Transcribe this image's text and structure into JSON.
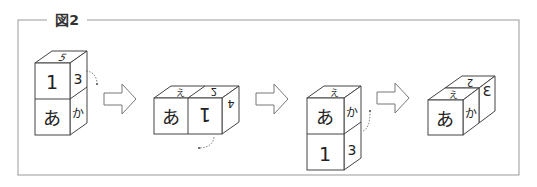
{
  "figure": {
    "title": "図2",
    "frame_color": "#999999",
    "line_color": "#444444"
  },
  "cubes": [
    {
      "id": "step1",
      "arrangement": "vertical-stack",
      "faces": {
        "top": "5",
        "upper_front": "1",
        "upper_side": "3",
        "lower_front": "あ",
        "lower_side": "か"
      },
      "rotation_hint": "curved dotted arrow from upper side face"
    },
    {
      "id": "step2",
      "arrangement": "horizontal-pair",
      "faces": {
        "left_top": "え",
        "right_top": "2",
        "left_front": "あ",
        "right_front": "1",
        "right_side": "4"
      },
      "rotation_hint": "curved dotted arrow below right cube"
    },
    {
      "id": "step3",
      "arrangement": "vertical-stack",
      "faces": {
        "top": "え",
        "upper_front": "あ",
        "upper_side": "か",
        "lower_front": "1",
        "lower_side": "3"
      },
      "rotation_hint": "curved dotted arrow from lower side face"
    },
    {
      "id": "step4",
      "arrangement": "depth-pair",
      "faces": {
        "front_top": "え",
        "back_top": "2",
        "front": "あ",
        "front_side": "か",
        "back_side": "3"
      }
    }
  ],
  "arrows": [
    "right-arrow",
    "right-arrow",
    "right-arrow"
  ]
}
